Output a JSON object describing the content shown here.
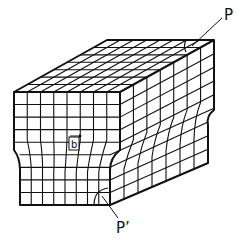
{
  "diagram": {
    "labels": {
      "top_point": "P",
      "bottom_point": "P’",
      "burgers_vector": "b"
    },
    "colors": {
      "line": "#111111",
      "background": "#ffffff"
    },
    "grid": {
      "front_columns": 8,
      "front_rows": 9,
      "top_depth_rows": 7,
      "side_columns": 7
    }
  }
}
